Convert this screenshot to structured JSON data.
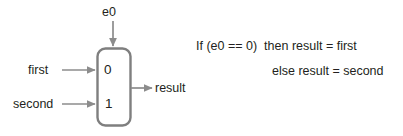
{
  "diagram": {
    "select": {
      "label": "e0",
      "icon": "down-arrow-icon"
    },
    "inputs": [
      {
        "label": "first",
        "port": "0",
        "icon": "right-arrow-icon"
      },
      {
        "label": "second",
        "port": "1",
        "icon": "right-arrow-icon"
      }
    ],
    "output": {
      "label": "result",
      "icon": "right-arrow-icon"
    },
    "ports": {
      "zero": "0",
      "one": "1"
    },
    "expression": {
      "line1": "If (e0 == 0)  then result = first",
      "line2": "else result = second"
    },
    "colors": {
      "box_stroke": "#7f7f7f",
      "arrow": "#8c8c8c",
      "text": "#231f20",
      "background": "#ffffff"
    }
  }
}
